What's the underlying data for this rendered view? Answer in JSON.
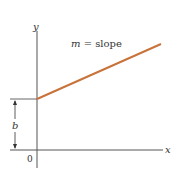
{
  "diagram": {
    "type": "slope-intercept line graph",
    "axes": {
      "x_label": "x",
      "y_label": "y",
      "origin_label": "0"
    },
    "line": {
      "annotation_var": "m",
      "annotation_eq": " = slope",
      "color": "#c8733a"
    },
    "intercept": {
      "label": "b"
    },
    "colors": {
      "axis": "#555555",
      "line": "#c8733a",
      "text": "#333333"
    }
  }
}
